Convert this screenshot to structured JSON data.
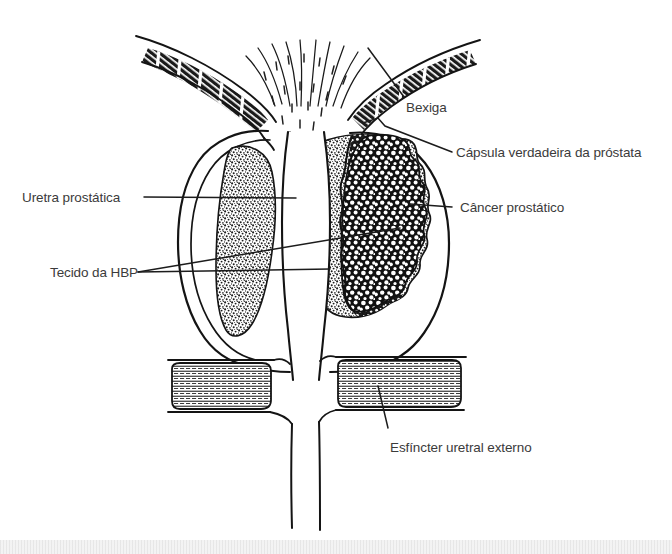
{
  "figure": {
    "language": "pt-BR",
    "ink_color": "#1a1a1a",
    "text_color": "#3b3b3b",
    "background_color": "#ffffff"
  },
  "labels": {
    "bexiga": "Bexiga",
    "capsula": "Cápsula verdadeira da próstata",
    "cancer": "Câncer prostático",
    "uretra": "Uretra prostática",
    "hbp": "Tecido da HBP",
    "esfincter": "Esfíncter uretral externo"
  },
  "structures": {
    "bladder_wall": "bladder-wall",
    "true_capsule": "prostate-true-capsule",
    "bph_tissue_left": "bph-tissue-left-lobe",
    "bph_tissue_right": "bph-tissue-right-lobe",
    "prostate_cancer": "prostate-cancer-mass",
    "prostatic_urethra": "prostatic-urethra-channel",
    "external_sphincter_left": "external-urethral-sphincter-left",
    "external_sphincter_right": "external-urethral-sphincter-right",
    "distal_urethra": "distal-urethra"
  }
}
